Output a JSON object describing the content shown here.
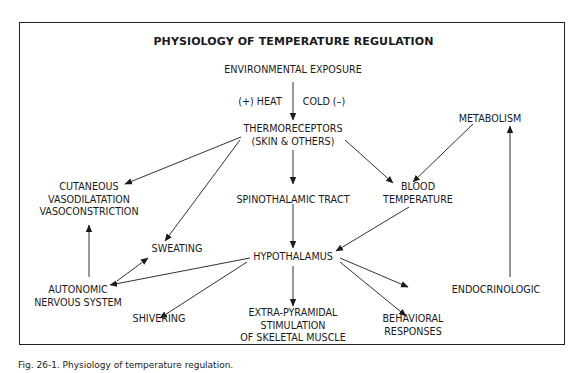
{
  "diagram": {
    "title": "PHYSIOLOGY OF TEMPERATURE REGULATION",
    "nodes": {
      "environmental_exposure": "ENVIRONMENTAL EXPOSURE",
      "heat_label": "(+) HEAT",
      "cold_label": "COLD (–)",
      "thermoreceptors_1": "THERMORECEPTORS",
      "thermoreceptors_2": "(SKIN & OTHERS)",
      "metabolism": "METABOLISM",
      "cutaneous_1": "CUTANEOUS",
      "cutaneous_2": "VASODILATATION",
      "cutaneous_3": "VASOCONSTRICTION",
      "spinothalamic": "SPINOTHALAMIC TRACT",
      "blood_1": "BLOOD",
      "blood_2": "TEMPERATURE",
      "sweating": "SWEATING",
      "hypothalamus": "HYPOTHALAMUS",
      "autonomic_1": "AUTONOMIC",
      "autonomic_2": "NERVOUS SYSTEM",
      "shivering": "SHIVERING",
      "extra_1": "EXTRA-PYRAMIDAL",
      "extra_2": "STIMULATION",
      "extra_3": "OF SKELETAL MUSCLE",
      "behavioral_1": "BEHAVIORAL",
      "behavioral_2": "RESPONSES",
      "endocrinologic": "ENDOCRINOLOGIC"
    },
    "edges": [
      [
        "Environmental Exposure",
        "Thermoreceptors"
      ],
      [
        "Thermoreceptors",
        "Cutaneous Vasodilatation/Vasoconstriction"
      ],
      [
        "Thermoreceptors",
        "Sweating"
      ],
      [
        "Thermoreceptors",
        "Spinothalamic Tract"
      ],
      [
        "Thermoreceptors",
        "Blood Temperature"
      ],
      [
        "Metabolism",
        "Blood Temperature"
      ],
      [
        "Spinothalamic Tract",
        "Hypothalamus"
      ],
      [
        "Blood Temperature",
        "Hypothalamus"
      ],
      [
        "Hypothalamus",
        "Autonomic Nervous System"
      ],
      [
        "Hypothalamus",
        "Shivering"
      ],
      [
        "Hypothalamus",
        "Extra-Pyramidal Stimulation of Skeletal Muscle"
      ],
      [
        "Hypothalamus",
        "Behavioral Responses"
      ],
      [
        "Hypothalamus",
        "Endocrinologic"
      ],
      [
        "Autonomic Nervous System",
        "Sweating"
      ],
      [
        "Autonomic Nervous System",
        "Cutaneous Vasodilatation/Vasoconstriction"
      ],
      [
        "Endocrinologic",
        "Metabolism"
      ]
    ]
  },
  "caption": "Fig. 26-1. Physiology of temperature regulation."
}
